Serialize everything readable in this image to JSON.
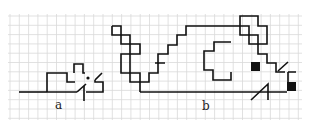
{
  "figure": {
    "labels": {
      "a": "a",
      "b": "b"
    },
    "colors": {
      "grid": "#d4d4d4",
      "stroke": "#111111",
      "background": "#ffffff"
    },
    "grid_cell_px": 9.3
  }
}
